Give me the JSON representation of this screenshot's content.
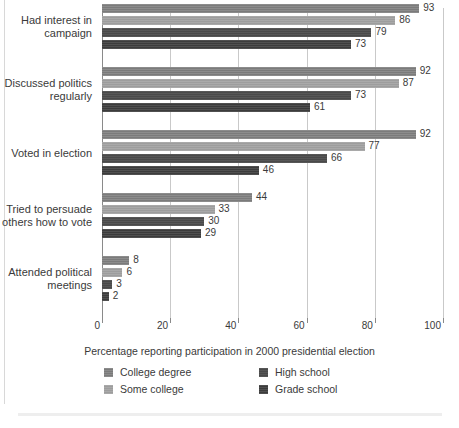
{
  "chart_data": {
    "type": "bar",
    "orientation": "horizontal",
    "title": "",
    "xlabel": "Percentage reporting participation in 2000 presidential election",
    "ylabel": "",
    "xlim": [
      0,
      100
    ],
    "xticks": [
      0,
      20,
      40,
      60,
      80,
      100
    ],
    "grid": true,
    "legend_position": "bottom",
    "categories": [
      "Had interest in campaign",
      "Discussed politics regularly",
      "Voted in election",
      "Tried to persuade others how to vote",
      "Attended political meetings"
    ],
    "series": [
      {
        "name": "College degree",
        "color": "#7b7b7b",
        "values": [
          93,
          92,
          92,
          44,
          8
        ]
      },
      {
        "name": "Some college",
        "color": "#9d9d9d",
        "values": [
          86,
          87,
          77,
          33,
          6
        ]
      },
      {
        "name": "High school",
        "color": "#4a4a4a",
        "values": [
          79,
          73,
          66,
          30,
          3
        ]
      },
      {
        "name": "Grade school",
        "color": "#3c3c3c",
        "values": [
          73,
          61,
          46,
          29,
          2
        ]
      }
    ]
  },
  "axis": {
    "tick_labels": [
      "0",
      "20",
      "40",
      "60",
      "80",
      "100"
    ],
    "title": "Percentage reporting participation in 2000 presidential election"
  },
  "category_labels": [
    {
      "line1": "Had interest in",
      "line2": "campaign"
    },
    {
      "line1": "Discussed politics",
      "line2": "regularly"
    },
    {
      "line1": "Voted in election",
      "line2": ""
    },
    {
      "line1": "Tried to persuade",
      "line2": "others how to vote"
    },
    {
      "line1": "Attended political",
      "line2": "meetings"
    }
  ],
  "legend": {
    "items": [
      {
        "label": "College degree",
        "color": "#7b7b7b"
      },
      {
        "label": "Some college",
        "color": "#9d9d9d"
      },
      {
        "label": "High school",
        "color": "#4a4a4a"
      },
      {
        "label": "Grade school",
        "color": "#3c3c3c"
      }
    ]
  },
  "colors": {
    "background": "#ffffff",
    "text": "#3a3a3a",
    "gridline": "#c9c9c9",
    "axis": "#8a8a8a",
    "border": "#d8d8d8",
    "bottom_band": "#eeeeee"
  }
}
